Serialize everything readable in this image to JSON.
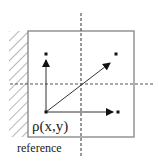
{
  "diagram": {
    "labels": {
      "point": "ρ(x,y)",
      "reference": "reference"
    },
    "colors": {
      "box_stroke": "#8c8c8c",
      "line": "#333333",
      "dashed": "#555555",
      "hatch": "#7a7a7a",
      "text": "#222222",
      "background": "#ffffff"
    },
    "elements": {
      "box": {
        "x": 28,
        "y": 31,
        "width": 106,
        "height": 106
      },
      "hatched_reference_wall": {
        "x": 9,
        "y": 31,
        "width": 19,
        "height": 106
      },
      "vertical_dashed_axis": {
        "x": 81,
        "y1": 13,
        "y2": 158
      },
      "horizontal_dashed_axis": {
        "y": 84,
        "x1": 10,
        "x2": 154
      },
      "origin_point": {
        "x": 46,
        "y": 112
      },
      "arrows": [
        {
          "name": "up-arrow",
          "from": [
            46,
            112
          ],
          "to": [
            46,
            60
          ],
          "target_dot": [
            46,
            54
          ]
        },
        {
          "name": "diagonal-arrow",
          "from": [
            46,
            112
          ],
          "to": [
            110,
            63
          ],
          "target_dot": [
            116,
            54
          ]
        },
        {
          "name": "right-arrow",
          "from": [
            46,
            112
          ],
          "to": [
            113,
            112
          ],
          "target_dot": [
            118,
            112
          ]
        }
      ]
    }
  }
}
